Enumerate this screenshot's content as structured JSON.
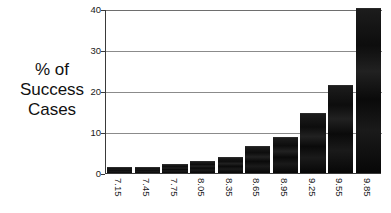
{
  "chart_data": {
    "type": "bar",
    "title": "",
    "xlabel": "",
    "ylabel": "% of Success Cases",
    "ylabel_lines": [
      "% of",
      "Success",
      "Cases"
    ],
    "categories": [
      "7.15",
      "7.45",
      "7.75",
      "8.05",
      "8.35",
      "8.65",
      "8.95",
      "9.25",
      "9.55",
      "9.85"
    ],
    "values": [
      1.3,
      1.2,
      2.0,
      2.7,
      3.6,
      6.4,
      8.6,
      14.3,
      21.3,
      40.0
    ],
    "ylim": [
      0,
      40
    ],
    "yticks": [
      0,
      10,
      20,
      30,
      40
    ],
    "ytick_labels": [
      "0",
      "10",
      "20",
      "30",
      "40"
    ],
    "grid": true,
    "legend": "none",
    "bar_color": "#151515",
    "axis_color": "#3a3a3a",
    "grid_color": "#8b8b8b",
    "background": "#ffffff",
    "xtick_rotation": 90
  }
}
